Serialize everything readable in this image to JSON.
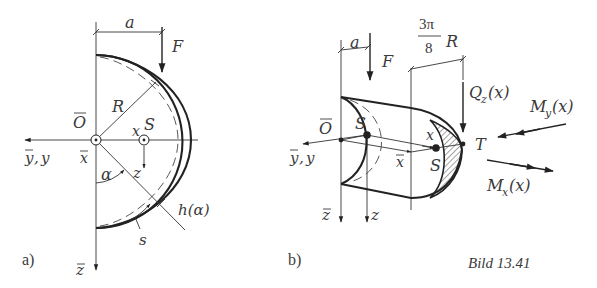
{
  "figure": {
    "caption": "Bild 13.41",
    "colors": {
      "line": "#222222",
      "text": "#3a3a3a",
      "background": "#ffffff"
    }
  },
  "part_a": {
    "label": "a)",
    "dimension_a": "a",
    "force": "F",
    "radius": "R",
    "origin": "O",
    "centroid": "S",
    "axis_x": "x",
    "axis_x_bar": "x",
    "axis_y": "y, y",
    "axis_y_main": "y",
    "axis_y_sep": ",",
    "axis_y_second": "y",
    "axis_z": "z",
    "axis_z_bar": "z",
    "angle": "α",
    "thickness": "h(α)",
    "arc_coord": "s"
  },
  "part_b": {
    "label": "b)",
    "dimension_a": "a",
    "force": "F",
    "dim_frac_num": "3π",
    "dim_frac_den": "8",
    "dim_R": "R",
    "origin": "O",
    "centroid_top": "S",
    "centroid_cut": "S",
    "axis_x": "x",
    "axis_x_bar": "x",
    "axis_y_main": "y",
    "axis_y_sep": ",",
    "axis_y_second": "y",
    "axis_z": "z",
    "axis_z_bar": "z",
    "point_T": "T",
    "shear": "Q",
    "shear_sub": "z",
    "shear_arg": "(x)",
    "moment_y": "M",
    "moment_y_sub": "y",
    "moment_y_arg": "(x)",
    "moment_x": "M",
    "moment_x_sub": "x",
    "moment_x_arg": "(x)"
  }
}
